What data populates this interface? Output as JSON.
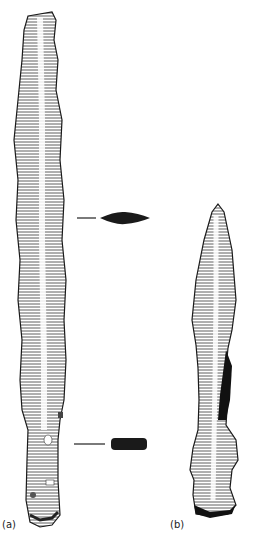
{
  "figure": {
    "labels": {
      "a": "(a)",
      "b": "(b)"
    },
    "items": [
      {
        "id": "a",
        "description": "long corroded iron blade with tang",
        "cross_sections": [
          "lens-shaped blade section",
          "rectangular tang section"
        ]
      },
      {
        "id": "b",
        "description": "leaf-shaped spearhead with socket"
      }
    ],
    "colors": {
      "ink": "#1a1a1a",
      "background": "#ffffff"
    }
  }
}
